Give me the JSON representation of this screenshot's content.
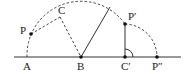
{
  "diagram": {
    "labels": {
      "A": "A",
      "B": "B",
      "C": "C",
      "P": "P",
      "P_prime": "P′",
      "C_prime": "C′",
      "P_double_prime": "P″"
    },
    "points": {
      "A": [
        27,
        57
      ],
      "B": [
        81,
        57
      ],
      "C": [
        60,
        17
      ],
      "P": [
        31,
        34
      ],
      "P_prime": [
        125,
        24
      ],
      "C_prime": [
        125,
        57
      ],
      "P_double_prime": [
        157,
        57
      ]
    },
    "colors": {
      "stroke": "#333333",
      "point": "#111111",
      "background": "#ffffff"
    }
  }
}
